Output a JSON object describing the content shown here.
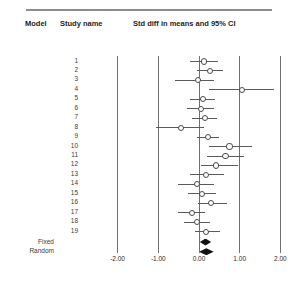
{
  "header": {
    "model_label": "Model",
    "study_label": "Study name",
    "stat_label": "Std diff in means and 95% CI"
  },
  "model_labels": {
    "fixed": "Fixed",
    "random": "Random"
  },
  "chart_data": {
    "type": "forest",
    "title": "Std diff in means and 95% CI",
    "xlabel": "",
    "ylabel": "",
    "xlim": [
      -2.4,
      2.4
    ],
    "grid": true,
    "gridlines": [
      -2.0,
      -1.0,
      0.0,
      1.0,
      2.0
    ],
    "null_line": 0.0,
    "tick_labels": [
      "-2.00",
      "-1.00",
      "0.00",
      "1.00",
      "2.00"
    ],
    "tick_values": [
      -2.0,
      -1.0,
      0.0,
      1.0,
      2.0
    ],
    "categories": [
      "1",
      "2",
      "3",
      "4",
      "5",
      "6",
      "7",
      "8",
      "9",
      "10",
      "11",
      "12",
      "13",
      "14",
      "15",
      "16",
      "17",
      "18",
      "19"
    ],
    "studies": [
      {
        "name": "1",
        "effect": 0.12,
        "lower": -0.22,
        "upper": 0.46
      },
      {
        "name": "2",
        "effect": 0.27,
        "lower": -0.05,
        "upper": 0.6
      },
      {
        "name": "3",
        "effect": -0.02,
        "lower": -0.6,
        "upper": 0.38
      },
      {
        "name": "4",
        "effect": 1.05,
        "lower": 0.25,
        "upper": 1.85
      },
      {
        "name": "5",
        "effect": 0.1,
        "lower": -0.22,
        "upper": 0.4
      },
      {
        "name": "6",
        "effect": 0.05,
        "lower": -0.3,
        "upper": 0.38
      },
      {
        "name": "7",
        "effect": 0.14,
        "lower": -0.16,
        "upper": 0.44
      },
      {
        "name": "8",
        "effect": -0.45,
        "lower": -1.05,
        "upper": 0.12
      },
      {
        "name": "9",
        "effect": 0.22,
        "lower": -0.05,
        "upper": 0.5
      },
      {
        "name": "10",
        "effect": 0.75,
        "lower": 0.25,
        "upper": 1.3
      },
      {
        "name": "11",
        "effect": 0.65,
        "lower": 0.2,
        "upper": 1.1
      },
      {
        "name": "12",
        "effect": 0.42,
        "lower": 0.05,
        "upper": 0.95
      },
      {
        "name": "13",
        "effect": 0.18,
        "lower": -0.22,
        "upper": 0.62
      },
      {
        "name": "14",
        "effect": -0.05,
        "lower": -0.52,
        "upper": 0.38
      },
      {
        "name": "15",
        "effect": 0.08,
        "lower": -0.28,
        "upper": 0.42
      },
      {
        "name": "16",
        "effect": 0.3,
        "lower": -0.02,
        "upper": 0.68
      },
      {
        "name": "17",
        "effect": -0.18,
        "lower": -0.52,
        "upper": 0.15
      },
      {
        "name": "18",
        "effect": -0.05,
        "lower": -0.38,
        "upper": 0.26
      },
      {
        "name": "19",
        "effect": 0.18,
        "lower": -0.1,
        "upper": 0.52
      }
    ],
    "summaries": [
      {
        "model": "Fixed",
        "effect": 0.16,
        "lower": 0.02,
        "upper": 0.3
      },
      {
        "model": "Random",
        "effect": 0.18,
        "lower": 0.0,
        "upper": 0.36
      }
    ]
  }
}
